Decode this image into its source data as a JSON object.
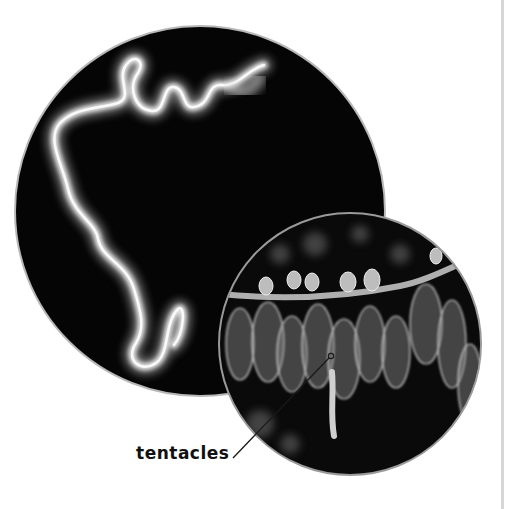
{
  "figure": {
    "main_photo": {
      "description": "Long, fuzzy, white siphonophore colony coiling against a black background",
      "shape": "circle"
    },
    "detail_photo": {
      "description": "Close-up of translucent swimming bells and gas-filled floats with dangling tentacles",
      "shape": "circle"
    },
    "callouts": [
      {
        "label": "tentacles"
      }
    ]
  },
  "colors": {
    "background": "#ffffff",
    "photo_background": "#050505",
    "circle_border": "#b8b8b8",
    "label_text": "#111111",
    "page_rule": "#d6d6d6"
  }
}
